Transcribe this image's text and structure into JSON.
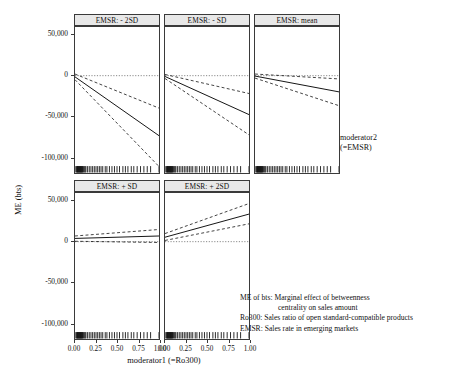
{
  "figure": {
    "axis_titles": {
      "y": "ME (bts)",
      "x": "moderator1 (=Ro300)"
    },
    "legend": {
      "line1": "moderator2",
      "line2": "(=EMSR)"
    },
    "caption": {
      "line1": "ME of bts: Marginal effect of betweenness",
      "line2": "centrality on sales amount",
      "line3": "Ro300: Sales ratio of open standard-compatible products",
      "line4": "EMSR: Sales rate in emerging markets"
    }
  },
  "chart_data": {
    "type": "line",
    "title": "",
    "xlabel": "moderator1 (=Ro300)",
    "ylabel": "ME (bts)",
    "xlim": [
      0,
      1
    ],
    "ylim": [
      -120000,
      60000
    ],
    "grid": false,
    "legend_position": "right",
    "x_ticks": [
      0.0,
      0.25,
      0.5,
      0.75,
      1.0
    ],
    "x_tick_labels": [
      "0.00",
      "0.25",
      "0.50",
      "0.75",
      "1.00"
    ],
    "y_ticks": [
      50000,
      0,
      -50000,
      -100000
    ],
    "y_tick_labels": [
      "50,000",
      "0",
      "-50,000",
      "-100,000"
    ],
    "reference_line_y": 0,
    "series_names": [
      "estimate",
      "upper CI",
      "lower CI"
    ],
    "line_styles": [
      "solid",
      "dashed",
      "dashed"
    ],
    "panels": [
      {
        "label": "EMSR: - 2SD",
        "row": 0,
        "col": 0,
        "x": [
          0.0,
          1.0
        ],
        "estimate": [
          -1500,
          -74000
        ],
        "upper": [
          2000,
          -40000
        ],
        "lower": [
          -5000,
          -112000
        ]
      },
      {
        "label": "EMSR: - SD",
        "row": 0,
        "col": 1,
        "x": [
          0.0,
          1.0
        ],
        "estimate": [
          -1000,
          -48000
        ],
        "upper": [
          1500,
          -22000
        ],
        "lower": [
          -3500,
          -73000
        ]
      },
      {
        "label": "EMSR: mean",
        "row": 0,
        "col": 2,
        "x": [
          0.0,
          1.0
        ],
        "estimate": [
          -500,
          -20000
        ],
        "upper": [
          2000,
          -4000
        ],
        "lower": [
          -3000,
          -37000
        ]
      },
      {
        "label": "EMSR: + SD",
        "row": 1,
        "col": 0,
        "x": [
          0.0,
          1.0
        ],
        "estimate": [
          4000,
          7000
        ],
        "upper": [
          7000,
          15000
        ],
        "lower": [
          500,
          -1000
        ]
      },
      {
        "label": "EMSR: + 2SD",
        "row": 1,
        "col": 1,
        "x": [
          0.0,
          1.0
        ],
        "estimate": [
          5500,
          34000
        ],
        "upper": [
          10000,
          47000
        ],
        "lower": [
          1500,
          22000
        ]
      }
    ],
    "rug_values": [
      0.01,
      0.02,
      0.025,
      0.03,
      0.035,
      0.04,
      0.045,
      0.05,
      0.055,
      0.06,
      0.065,
      0.07,
      0.075,
      0.08,
      0.085,
      0.09,
      0.1,
      0.11,
      0.12,
      0.13,
      0.15,
      0.17,
      0.19,
      0.21,
      0.23,
      0.25,
      0.27,
      0.29,
      0.31,
      0.33,
      0.36,
      0.38,
      0.41,
      0.44,
      0.47,
      0.5,
      0.53,
      0.57,
      0.6,
      0.63,
      0.67,
      0.7,
      0.74,
      0.78,
      0.82,
      0.86,
      0.9,
      1.0
    ]
  }
}
